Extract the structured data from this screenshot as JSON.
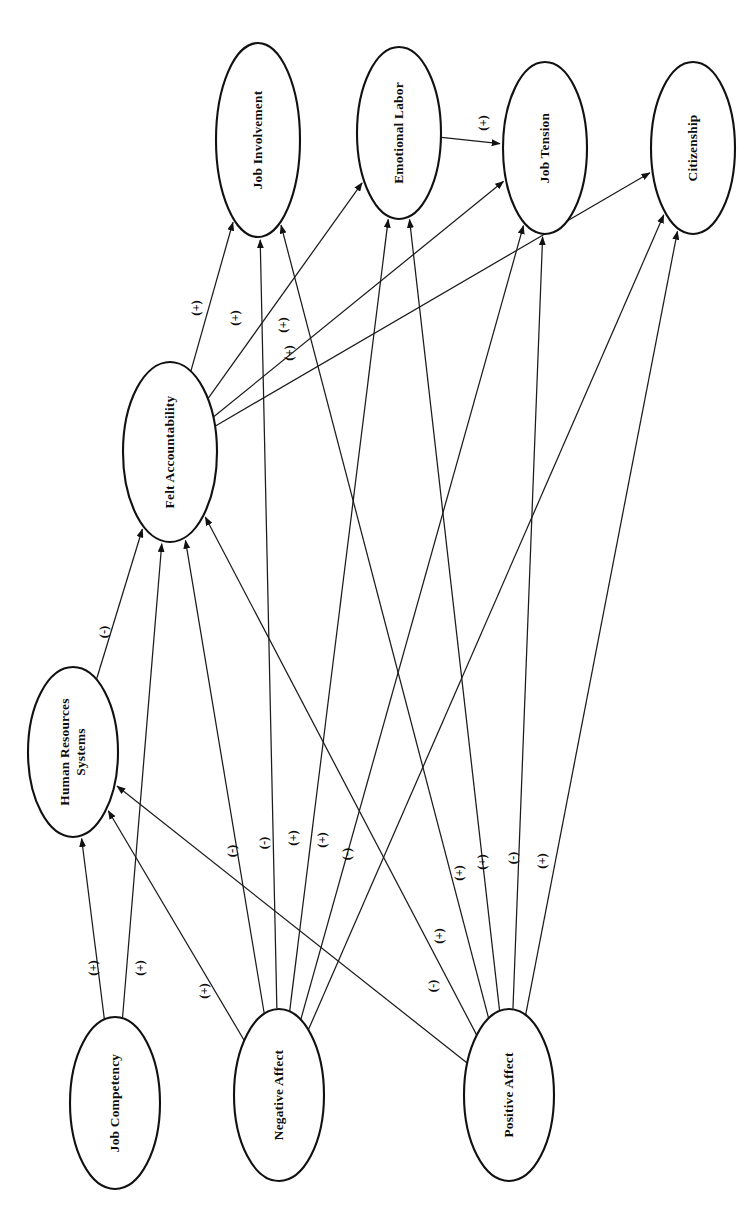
{
  "diagram": {
    "type": "path-model",
    "orientation": "rotated-90-ccw",
    "background_color": "#ffffff",
    "line_color": "#1b1b1b",
    "nodes": [
      {
        "id": "job_involvement",
        "label": "Job Involvement",
        "cx": 258,
        "cy": 140,
        "rx": 42,
        "ry": 97
      },
      {
        "id": "emotional_labor",
        "label": "Emotional Labor",
        "cx": 399,
        "cy": 133,
        "rx": 42,
        "ry": 86
      },
      {
        "id": "job_tension",
        "label": "Job Tension",
        "cx": 545,
        "cy": 148,
        "rx": 42,
        "ry": 86
      },
      {
        "id": "citizenship",
        "label": "Citizenship",
        "cx": 693,
        "cy": 148,
        "rx": 42,
        "ry": 86
      },
      {
        "id": "felt_accountability",
        "label": "Felt Accountability",
        "cx": 170,
        "cy": 452,
        "rx": 47,
        "ry": 90
      },
      {
        "id": "hr_systems",
        "label": "Human Resources\nSystems",
        "cx": 73,
        "cy": 752,
        "rx": 45,
        "ry": 85
      },
      {
        "id": "job_competency",
        "label": "Job Competency",
        "cx": 115,
        "cy": 1103,
        "rx": 45,
        "ry": 86
      },
      {
        "id": "negative_affect",
        "label": "Negative Affect",
        "cx": 279,
        "cy": 1095,
        "rx": 45,
        "ry": 86
      },
      {
        "id": "positive_affect",
        "label": "Positive Affect",
        "cx": 509,
        "cy": 1095,
        "rx": 45,
        "ry": 86
      }
    ],
    "edges": [
      {
        "id": "e-el-jt",
        "from": "emotional_labor",
        "to": "job_tension",
        "sign": "(+)"
      },
      {
        "id": "e-fa-ji",
        "from": "felt_accountability",
        "to": "job_involvement",
        "sign": "(+)"
      },
      {
        "id": "e-fa-el",
        "from": "felt_accountability",
        "to": "emotional_labor",
        "sign": "(+)"
      },
      {
        "id": "e-fa-jt",
        "from": "felt_accountability",
        "to": "job_tension",
        "sign": "(+)"
      },
      {
        "id": "e-fa-cz",
        "from": "felt_accountability",
        "to": "citizenship",
        "sign": "(+)"
      },
      {
        "id": "e-hr-fa",
        "from": "hr_systems",
        "to": "felt_accountability",
        "sign": "(-)"
      },
      {
        "id": "e-jc-hr",
        "from": "job_competency",
        "to": "hr_systems",
        "sign": "(+)"
      },
      {
        "id": "e-jc-fa",
        "from": "job_competency",
        "to": "felt_accountability",
        "sign": "(+)"
      },
      {
        "id": "e-na-hr",
        "from": "negative_affect",
        "to": "hr_systems",
        "sign": "(+)"
      },
      {
        "id": "e-na-fa",
        "from": "negative_affect",
        "to": "felt_accountability",
        "sign": "(-)"
      },
      {
        "id": "e-na-ji",
        "from": "negative_affect",
        "to": "job_involvement",
        "sign": "(-)"
      },
      {
        "id": "e-na-el",
        "from": "negative_affect",
        "to": "emotional_labor",
        "sign": "(+)"
      },
      {
        "id": "e-na-jt",
        "from": "negative_affect",
        "to": "job_tension",
        "sign": "(+)"
      },
      {
        "id": "e-na-cz",
        "from": "negative_affect",
        "to": "citizenship",
        "sign": "(-)"
      },
      {
        "id": "e-pa-hr",
        "from": "positive_affect",
        "to": "hr_systems",
        "sign": "(-)"
      },
      {
        "id": "e-pa-fa",
        "from": "positive_affect",
        "to": "felt_accountability",
        "sign": "(+)"
      },
      {
        "id": "e-pa-ji",
        "from": "positive_affect",
        "to": "job_involvement",
        "sign": "(+)"
      },
      {
        "id": "e-pa-el",
        "from": "positive_affect",
        "to": "emotional_labor",
        "sign": "(+)"
      },
      {
        "id": "e-pa-jt",
        "from": "positive_affect",
        "to": "job_tension",
        "sign": "(-)"
      },
      {
        "id": "e-pa-cz",
        "from": "positive_affect",
        "to": "citizenship",
        "sign": "(+)"
      }
    ],
    "sign_positions": [
      {
        "id": "s-el-jt",
        "edge": "e-el-jt",
        "text": "(+)",
        "x": 483,
        "y": 123
      },
      {
        "id": "s-fa-ji",
        "edge": "e-fa-ji",
        "text": "(+)",
        "x": 196,
        "y": 308
      },
      {
        "id": "s-fa-el",
        "edge": "e-fa-el",
        "text": "(+)",
        "x": 235,
        "y": 318
      },
      {
        "id": "s-fa-jt",
        "edge": "e-fa-jt",
        "text": "(+)",
        "x": 283,
        "y": 325
      },
      {
        "id": "s-fa-cz",
        "edge": "e-fa-cz",
        "text": "(+)",
        "x": 289,
        "y": 353
      },
      {
        "id": "s-hr-fa",
        "edge": "e-hr-fa",
        "text": "(-)",
        "x": 104,
        "y": 632
      },
      {
        "id": "s-jc-hr",
        "edge": "e-jc-hr",
        "text": "(+)",
        "x": 93,
        "y": 968
      },
      {
        "id": "s-jc-fa",
        "edge": "e-jc-fa",
        "text": "(+)",
        "x": 140,
        "y": 968
      },
      {
        "id": "s-na-hr",
        "edge": "e-na-hr",
        "text": "(+)",
        "x": 204,
        "y": 991
      },
      {
        "id": "s-na-fa",
        "edge": "e-na-fa",
        "text": "(-)",
        "x": 232,
        "y": 851
      },
      {
        "id": "s-na-ji",
        "edge": "e-na-ji",
        "text": "(-)",
        "x": 264,
        "y": 843
      },
      {
        "id": "s-na-el",
        "edge": "e-na-el",
        "text": "(+)",
        "x": 293,
        "y": 838
      },
      {
        "id": "s-na-jt",
        "edge": "e-na-jt",
        "text": "(+)",
        "x": 322,
        "y": 840
      },
      {
        "id": "s-na-cz",
        "edge": "e-na-cz",
        "text": "(-)",
        "x": 347,
        "y": 854
      },
      {
        "id": "s-pa-hr",
        "edge": "e-pa-hr",
        "text": "(-)",
        "x": 433,
        "y": 986
      },
      {
        "id": "s-pa-fa",
        "edge": "e-pa-fa",
        "text": "(+)",
        "x": 439,
        "y": 936
      },
      {
        "id": "s-pa-ji",
        "edge": "e-pa-ji",
        "text": "(+)",
        "x": 459,
        "y": 873
      },
      {
        "id": "s-pa-el",
        "edge": "e-pa-el",
        "text": "(+)",
        "x": 482,
        "y": 862
      },
      {
        "id": "s-pa-jt",
        "edge": "e-pa-jt",
        "text": "(-)",
        "x": 513,
        "y": 858
      },
      {
        "id": "s-pa-cz",
        "edge": "e-pa-cz",
        "text": "(+)",
        "x": 542,
        "y": 861
      }
    ]
  }
}
